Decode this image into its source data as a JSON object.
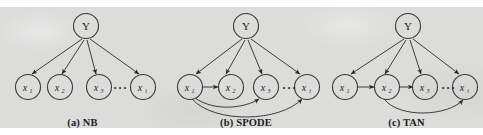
{
  "figure": {
    "background_color": "#dcdcdb",
    "ink_color": "#2a2a2a",
    "panels": [
      {
        "id": "nb",
        "caption": "(a) NB",
        "class_node": "Y",
        "attribute_nodes": [
          "x",
          "x",
          "x",
          "x"
        ],
        "attribute_subscripts": [
          "1",
          "2",
          "3",
          "i"
        ],
        "ellipsis": "···",
        "edges_from_class": [
          "Y→x1",
          "Y→x2",
          "Y→x3",
          "Y→xi"
        ],
        "edges_between_attributes": []
      },
      {
        "id": "spode",
        "caption": "(b) SPODE",
        "class_node": "Y",
        "attribute_nodes": [
          "x",
          "x",
          "x",
          "x"
        ],
        "attribute_subscripts": [
          "1",
          "2",
          "3",
          "i"
        ],
        "ellipsis": "···",
        "edges_from_class": [
          "Y→x1",
          "Y→x2",
          "Y→x3",
          "Y→xi"
        ],
        "edges_between_attributes": [
          "x1→x2",
          "x1→x3",
          "x1→xi"
        ]
      },
      {
        "id": "tan",
        "caption": "(c) TAN",
        "class_node": "Y",
        "attribute_nodes": [
          "x",
          "x",
          "x",
          "x"
        ],
        "attribute_subscripts": [
          "1",
          "2",
          "3",
          "i"
        ],
        "ellipsis": "···",
        "edges_from_class": [
          "Y→x1",
          "Y→x2",
          "Y→x3",
          "Y→xi"
        ],
        "edges_between_attributes": [
          "x1→x2",
          "x2→x3",
          "x2→xi"
        ]
      }
    ]
  }
}
